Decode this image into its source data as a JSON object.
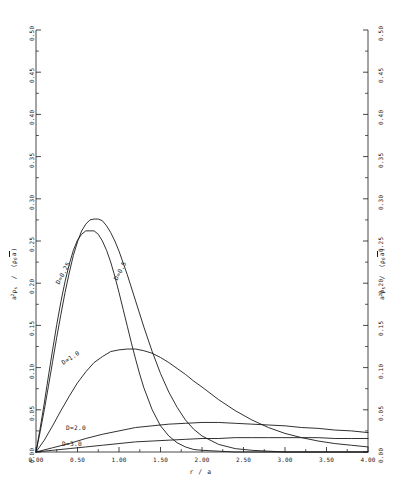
{
  "chart_data": {
    "type": "line",
    "title": "",
    "xlabel": "r / a",
    "ylabel_html": "a<sup>2</sup>ρ<sub>s</sub> / (ρ<sub>0</sub>√a)",
    "xlim": [
      0.0,
      4.0
    ],
    "ylim": [
      0.0,
      0.5
    ],
    "xticks": [
      "0.00",
      "0.50",
      "1.00",
      "1.50",
      "2.00",
      "2.50",
      "3.00",
      "3.50",
      "4.00"
    ],
    "xtick_values": [
      0.0,
      0.5,
      1.0,
      1.5,
      2.0,
      2.5,
      3.0,
      3.5,
      4.0
    ],
    "yticks": [
      "0.00",
      "0.05",
      "0.10",
      "0.15",
      "0.20",
      "0.25",
      "0.30",
      "0.35",
      "0.40",
      "0.45",
      "0.50"
    ],
    "ytick_values": [
      0.0,
      0.05,
      0.1,
      0.15,
      0.2,
      0.25,
      0.3,
      0.35,
      0.4,
      0.45,
      0.5
    ],
    "xminor_step": 0.25,
    "yminor_step": 0.025,
    "grid": false,
    "legend": "inline-curve-labels",
    "right_axis_mirrored": true,
    "right_axis_label_html": "a<sup>2</sup>ρ<sub>s</sub> / (ρ<sub>0</sub>√a)",
    "line_color": "#1a1a1a",
    "line_width": 0.9,
    "series": [
      {
        "name": "D=0.25",
        "label": "D=0.25",
        "label_rotation_deg": -62,
        "peak_x": 0.7,
        "peak_y": 0.262,
        "x": [
          0.0,
          0.05,
          0.1,
          0.15,
          0.2,
          0.25,
          0.3,
          0.35,
          0.4,
          0.45,
          0.5,
          0.55,
          0.6,
          0.65,
          0.7,
          0.75,
          0.8,
          0.85,
          0.9,
          0.95,
          1.0,
          1.05,
          1.1,
          1.15,
          1.2,
          1.25,
          1.3,
          1.4,
          1.5,
          1.6,
          1.7,
          1.8,
          1.9,
          2.0,
          2.2,
          2.4,
          2.6,
          3.0,
          3.5,
          4.0
        ],
        "y": [
          0.0,
          0.028,
          0.058,
          0.09,
          0.121,
          0.151,
          0.178,
          0.202,
          0.222,
          0.239,
          0.251,
          0.258,
          0.262,
          0.262,
          0.262,
          0.258,
          0.25,
          0.239,
          0.225,
          0.208,
          0.189,
          0.169,
          0.149,
          0.129,
          0.11,
          0.092,
          0.076,
          0.05,
          0.031,
          0.019,
          0.011,
          0.006,
          0.003,
          0.002,
          0.001,
          0.0,
          0.0,
          0.0,
          0.0,
          0.0
        ]
      },
      {
        "name": "D=0.5",
        "label": "D=0.5",
        "label_rotation_deg": -62,
        "peak_x": 0.78,
        "peak_y": 0.276,
        "x": [
          0.0,
          0.05,
          0.1,
          0.15,
          0.2,
          0.25,
          0.3,
          0.35,
          0.4,
          0.45,
          0.5,
          0.55,
          0.6,
          0.65,
          0.7,
          0.75,
          0.8,
          0.85,
          0.9,
          0.95,
          1.0,
          1.1,
          1.2,
          1.3,
          1.4,
          1.5,
          1.6,
          1.7,
          1.8,
          1.9,
          2.0,
          2.2,
          2.4,
          2.6,
          2.8,
          3.0,
          3.5,
          4.0
        ],
        "y": [
          0.0,
          0.024,
          0.05,
          0.078,
          0.107,
          0.136,
          0.163,
          0.189,
          0.212,
          0.233,
          0.249,
          0.262,
          0.27,
          0.275,
          0.276,
          0.276,
          0.274,
          0.268,
          0.26,
          0.25,
          0.238,
          0.21,
          0.179,
          0.148,
          0.119,
          0.093,
          0.071,
          0.053,
          0.038,
          0.027,
          0.019,
          0.009,
          0.004,
          0.002,
          0.001,
          0.0,
          0.0,
          0.0
        ]
      },
      {
        "name": "D=1.0",
        "label": "D=1.0",
        "label_rotation_deg": -33,
        "peak_x": 1.18,
        "peak_y": 0.122,
        "x": [
          0.0,
          0.1,
          0.2,
          0.3,
          0.4,
          0.5,
          0.6,
          0.7,
          0.8,
          0.9,
          1.0,
          1.1,
          1.2,
          1.3,
          1.4,
          1.5,
          1.6,
          1.7,
          1.8,
          1.9,
          2.0,
          2.2,
          2.4,
          2.6,
          2.8,
          3.0,
          3.2,
          3.4,
          3.6,
          3.8,
          4.0
        ],
        "y": [
          0.0,
          0.014,
          0.031,
          0.049,
          0.066,
          0.082,
          0.095,
          0.106,
          0.113,
          0.119,
          0.121,
          0.122,
          0.122,
          0.12,
          0.117,
          0.112,
          0.106,
          0.099,
          0.092,
          0.084,
          0.077,
          0.062,
          0.049,
          0.038,
          0.029,
          0.022,
          0.017,
          0.013,
          0.01,
          0.008,
          0.006
        ]
      },
      {
        "name": "D=2.0",
        "label": "D=2.0",
        "label_rotation_deg": 0,
        "peak_x": 2.0,
        "peak_y": 0.035,
        "x": [
          0.0,
          0.2,
          0.4,
          0.6,
          0.8,
          1.0,
          1.2,
          1.4,
          1.6,
          1.8,
          2.0,
          2.2,
          2.4,
          2.6,
          2.8,
          3.0,
          3.2,
          3.4,
          3.6,
          3.8,
          4.0
        ],
        "y": [
          0.0,
          0.005,
          0.01,
          0.016,
          0.021,
          0.025,
          0.029,
          0.031,
          0.033,
          0.034,
          0.035,
          0.035,
          0.034,
          0.033,
          0.032,
          0.031,
          0.029,
          0.028,
          0.026,
          0.025,
          0.023
        ]
      },
      {
        "name": "D=3.0",
        "label": "D=3.0",
        "label_rotation_deg": 0,
        "peak_x": 3.2,
        "peak_y": 0.017,
        "x": [
          0.0,
          0.2,
          0.4,
          0.6,
          0.8,
          1.0,
          1.2,
          1.4,
          1.6,
          1.8,
          2.0,
          2.2,
          2.4,
          2.6,
          2.8,
          3.0,
          3.2,
          3.4,
          3.6,
          3.8,
          4.0
        ],
        "y": [
          0.0,
          0.002,
          0.004,
          0.006,
          0.008,
          0.01,
          0.012,
          0.013,
          0.014,
          0.015,
          0.016,
          0.016,
          0.017,
          0.017,
          0.017,
          0.017,
          0.017,
          0.017,
          0.016,
          0.016,
          0.016
        ]
      }
    ]
  },
  "axes": {
    "left_title_parts": {
      "a": "a",
      "exp": "2",
      "rho": "ρ",
      "sub_s": "s",
      "slash": "/",
      "open": "(",
      "rho0": "ρ",
      "sub_0": "0",
      "sqrt": "√",
      "inner": "a",
      "close": ")"
    },
    "x_axis_label": "r / a"
  }
}
